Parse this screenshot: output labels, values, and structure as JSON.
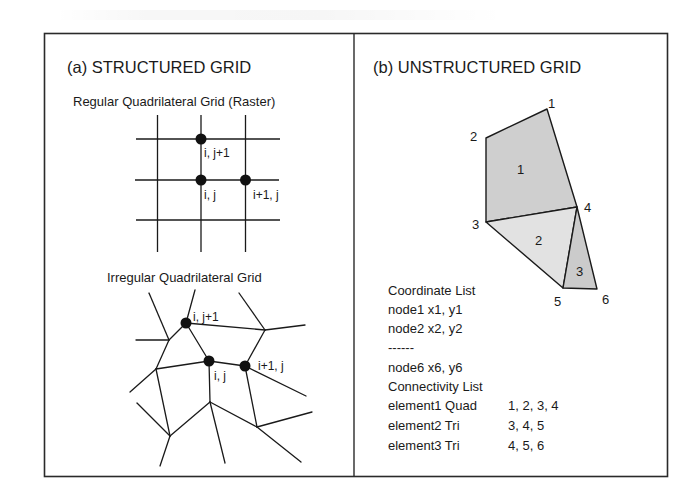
{
  "panel_a": {
    "title": "(a) STRUCTURED GRID",
    "regular": {
      "subtitle": "Regular Quadrilateral Grid (Raster)",
      "labels": {
        "i_jp1": "i, j+1",
        "i_j": "i, j",
        "ip1_j": "i+1, j"
      }
    },
    "irregular": {
      "subtitle": "Irregular Quadrilateral Grid",
      "labels": {
        "i_jp1": "i, j+1",
        "i_j": "i, j",
        "ip1_j": "i+1, j"
      }
    }
  },
  "panel_b": {
    "title": "(b) UNSTRUCTURED GRID",
    "nodes": [
      {
        "id": "1",
        "label": "1"
      },
      {
        "id": "2",
        "label": "2"
      },
      {
        "id": "3",
        "label": "3"
      },
      {
        "id": "4",
        "label": "4"
      },
      {
        "id": "5",
        "label": "5"
      },
      {
        "id": "6",
        "label": "6"
      }
    ],
    "elements": [
      {
        "label": "1",
        "type": "Quad",
        "nodes": "1, 2, 3, 4",
        "fill": "#cfcfcf"
      },
      {
        "label": "2",
        "type": "Tri",
        "nodes": "3, 4, 5",
        "fill": "#e2e2e2"
      },
      {
        "label": "3",
        "type": "Tri",
        "nodes": "4, 5, 6",
        "fill": "#cbcbcb"
      }
    ],
    "coordinate_list": {
      "heading": "Coordinate List",
      "lines": [
        "node1 x1, y1",
        "node2 x2, y2",
        "------",
        "node6 x6, y6"
      ]
    },
    "connectivity_list": {
      "heading": "Connectivity List",
      "rows": [
        {
          "name": "element1 Quad",
          "nodes": "1, 2, 3, 4"
        },
        {
          "name": "element2 Tri",
          "nodes": "3, 4, 5"
        },
        {
          "name": "element3 Tri",
          "nodes": "4, 5, 6"
        }
      ]
    }
  },
  "colors": {
    "line": "#1a1a1a",
    "border": "#2a2a2a"
  }
}
